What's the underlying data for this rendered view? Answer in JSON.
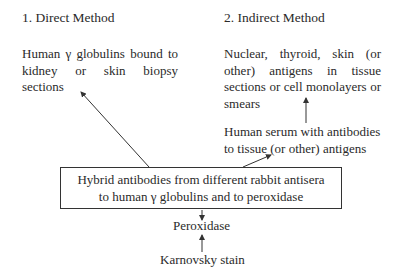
{
  "direct": {
    "heading": "1. Direct Method",
    "text": "Human γ globulins bound to kidney or skin biopsy sections"
  },
  "indirect": {
    "heading": "2. Indirect Method",
    "antigens_text": "Nuclear, thyroid, skin (or other) antigens in tissue sections or cell monolayers or smears",
    "serum_text_line1": "Human serum with antibodies",
    "serum_text_line2": "to tissue (or other) antigens"
  },
  "center_box": {
    "line1": "Hybrid antibodies from different rabbit antisera",
    "line2": "to human γ globulins and to peroxidase"
  },
  "peroxidase": "Peroxidase",
  "stain": "Karnovsky stain",
  "colors": {
    "ink": "#2a2a2a",
    "line": "#333333",
    "background": "#ffffff"
  }
}
